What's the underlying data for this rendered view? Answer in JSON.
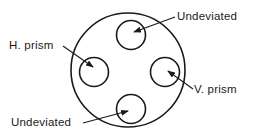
{
  "diagram": {
    "type": "lens-zone-layout",
    "colors": {
      "stroke": "#1a1a1a",
      "background": "#ffffff"
    },
    "outer_circle": {
      "cx": 128,
      "cy": 70,
      "r": 57
    },
    "zones": [
      {
        "id": "top",
        "cx": 131,
        "cy": 35,
        "r": 14.5,
        "label": "Undeviated"
      },
      {
        "id": "left",
        "cx": 94,
        "cy": 72,
        "r": 14.5,
        "label": "H. prism"
      },
      {
        "id": "right",
        "cx": 165,
        "cy": 72,
        "r": 14.5,
        "label": "V. prism"
      },
      {
        "id": "bottom",
        "cx": 131,
        "cy": 109,
        "r": 14.5,
        "label": "Undeviated"
      }
    ],
    "labels": {
      "top": "Undeviated",
      "left": "H. prism",
      "right": "V. prism",
      "bottom": "Undeviated"
    }
  }
}
